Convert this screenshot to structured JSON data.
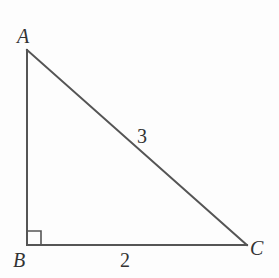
{
  "diagram": {
    "type": "right-triangle",
    "colors": {
      "background": "#fdfdfd",
      "stroke": "#555555",
      "text": "#333333"
    },
    "vertices": {
      "A": {
        "label": "A",
        "x": 27,
        "y": 50
      },
      "B": {
        "label": "B",
        "x": 27,
        "y": 245
      },
      "C": {
        "label": "C",
        "x": 247,
        "y": 245
      }
    },
    "sides": {
      "AC": {
        "label": "3"
      },
      "BC": {
        "label": "2"
      }
    },
    "right_angle_at": "B"
  }
}
